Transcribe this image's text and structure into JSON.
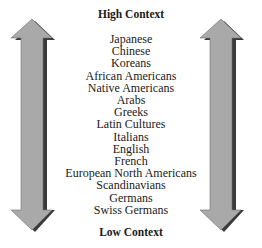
{
  "diagram": {
    "top_label": "High Context",
    "bottom_label": "Low Context",
    "items": [
      "Japanese",
      "Chinese",
      "Koreans",
      "African Americans",
      "Native Americans",
      "Arabs",
      "Greeks",
      "Latin Cultures",
      "Italians",
      "English",
      "French",
      "European North Americans",
      "Scandinavians",
      "Germans",
      "Swiss Germans"
    ],
    "arrow_fill": "#a9a9a9",
    "arrow_shadow": "#3a3a3a"
  }
}
